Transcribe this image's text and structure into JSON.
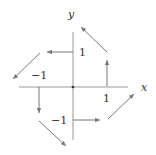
{
  "diagram": {
    "type": "vector-field",
    "axes": {
      "x_label": "x",
      "y_label": "y"
    },
    "tick_labels": {
      "x_pos": "1",
      "x_neg": "−1",
      "y_pos": "1",
      "y_neg": "−1"
    },
    "colors": {
      "axis": "#999999",
      "arrow": "#777777",
      "text": "#333333"
    },
    "arrows": [
      {
        "at": "(0,1)",
        "direction": "left"
      },
      {
        "at": "(1,0)",
        "direction": "up"
      },
      {
        "at": "(0,-1)",
        "direction": "right"
      },
      {
        "at": "(-1,0)",
        "direction": "down"
      },
      {
        "at": "(1,1)",
        "direction": "up-left"
      },
      {
        "at": "(-1,1)",
        "direction": "down-left"
      },
      {
        "at": "(-1,-1)",
        "direction": "down-right"
      },
      {
        "at": "(1,-1)",
        "direction": "up-right"
      }
    ]
  }
}
